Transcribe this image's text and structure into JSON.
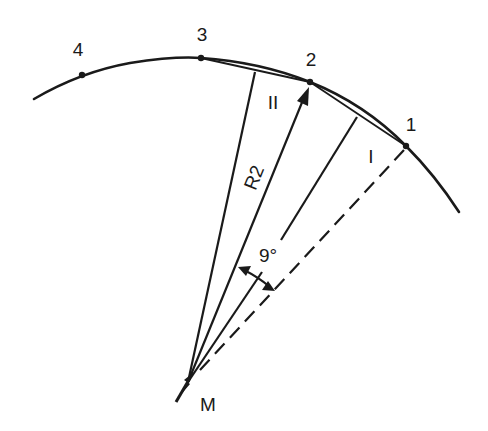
{
  "diagram": {
    "title": "",
    "colors": {
      "stroke": "#1a1a1a",
      "background": "#ffffff"
    },
    "points": [
      {
        "id": "4",
        "label": "4",
        "x": 82,
        "y": 75,
        "label_x": 78,
        "label_y": 56
      },
      {
        "id": "3",
        "label": "3",
        "x": 201,
        "y": 58,
        "label_x": 202,
        "label_y": 41
      },
      {
        "id": "2",
        "label": "2",
        "x": 310,
        "y": 82,
        "label_x": 311,
        "label_y": 66
      },
      {
        "id": "1",
        "label": "1",
        "x": 406,
        "y": 146,
        "label_x": 411,
        "label_y": 131
      }
    ],
    "center": {
      "label": "M",
      "x": 188,
      "y": 382
    },
    "sections": [
      {
        "label": "II",
        "between": [
          "3",
          "2"
        ]
      },
      {
        "label": "I",
        "between": [
          "2",
          "1"
        ]
      }
    ],
    "radius_label": "R2",
    "angle_label": "9°"
  }
}
